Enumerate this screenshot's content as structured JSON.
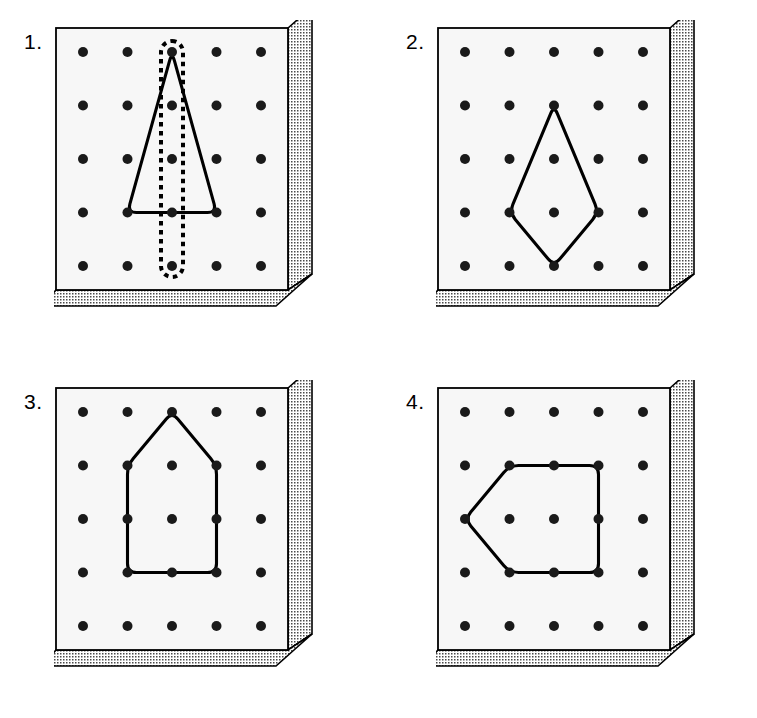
{
  "document": {
    "title": "Geoboard Shapes — Lines of Symmetry",
    "background_color": "#ffffff",
    "top_cut_off_text": "",
    "width": 757,
    "height": 718
  },
  "style": {
    "board_face_color": "#f7f7f7",
    "board_edge_color": "#000000",
    "board_shade_color": "#d9d9d9",
    "peg_color": "#1a1a1a",
    "shape_outline_color": "#000000",
    "symmetry_line_color": "#000000"
  },
  "geoboard": {
    "grid_rows": 5,
    "grid_cols": 5,
    "peg_radius": 5,
    "peg_count": 25
  },
  "panels": [
    {
      "number": "1.",
      "name": "panel-triangle-with-symmetry-line",
      "shape": {
        "name": "isosceles-triangle",
        "closed": true,
        "vertices": [
          {
            "col": 3,
            "row": 1
          },
          {
            "col": 4,
            "row": 4
          },
          {
            "col": 2,
            "row": 4
          }
        ]
      },
      "symmetry_band": {
        "present": true,
        "style": "dashed-capsule",
        "orientation": "vertical",
        "col": 3,
        "from_row": 1,
        "to_row": 5
      }
    },
    {
      "number": "2.",
      "name": "panel-kite",
      "shape": {
        "name": "kite",
        "closed": true,
        "vertices": [
          {
            "col": 3,
            "row": 2
          },
          {
            "col": 4,
            "row": 4
          },
          {
            "col": 3,
            "row": 5
          },
          {
            "col": 2,
            "row": 4
          }
        ]
      },
      "symmetry_band": {
        "present": false
      }
    },
    {
      "number": "3.",
      "name": "panel-house-pentagon",
      "shape": {
        "name": "pentagon-house",
        "closed": true,
        "vertices": [
          {
            "col": 3,
            "row": 1
          },
          {
            "col": 4,
            "row": 2
          },
          {
            "col": 4,
            "row": 4
          },
          {
            "col": 2,
            "row": 4
          },
          {
            "col": 2,
            "row": 2
          }
        ]
      },
      "symmetry_band": {
        "present": false
      }
    },
    {
      "number": "4.",
      "name": "panel-left-pointing-pentagon",
      "shape": {
        "name": "pentagon-arrow-left",
        "closed": true,
        "vertices": [
          {
            "col": 2,
            "row": 2
          },
          {
            "col": 4,
            "row": 2
          },
          {
            "col": 4,
            "row": 4
          },
          {
            "col": 2,
            "row": 4
          },
          {
            "col": 1,
            "row": 3
          }
        ]
      },
      "symmetry_band": {
        "present": false
      }
    }
  ]
}
